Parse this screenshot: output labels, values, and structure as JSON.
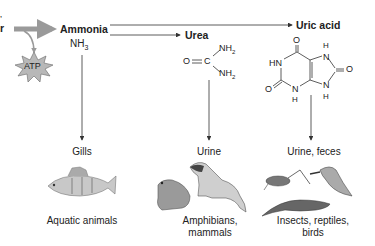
{
  "diagram": {
    "left_fragment": {
      "line1": "’",
      "line2": "r"
    },
    "atp": {
      "label": "ATP",
      "fill": "#b8b8b8"
    },
    "compounds": {
      "ammonia": {
        "name": "Ammonia",
        "formula_base": "NH",
        "formula_sub": "3"
      },
      "urea": {
        "name": "Urea",
        "o": "O",
        "c": "C",
        "nh2_top": "NH",
        "nh2_bot": "NH",
        "sub": "2",
        "double_bond": "="
      },
      "uric_acid": {
        "name": "Uric acid",
        "atoms": {
          "o_top": "O",
          "h_top": "H",
          "n_top": "N",
          "hn": "HN",
          "o_right": "O",
          "o_left": "O",
          "n_bot_left": "N",
          "h_bot_left": "H",
          "n_bot_right": "N",
          "h_bot_right": "H"
        }
      }
    },
    "excretion": [
      {
        "route": "Gills",
        "animals": "Aquatic animals",
        "animals_line2": ""
      },
      {
        "route": "Urine",
        "animals": "Amphibians,",
        "animals_line2": "mammals"
      },
      {
        "route": "Urine, feces",
        "animals": "Insects, reptiles,",
        "animals_line2": "birds"
      }
    ],
    "colors": {
      "arrow_gray": "#9a9a9a",
      "line": "#333333",
      "text": "#222222"
    }
  }
}
